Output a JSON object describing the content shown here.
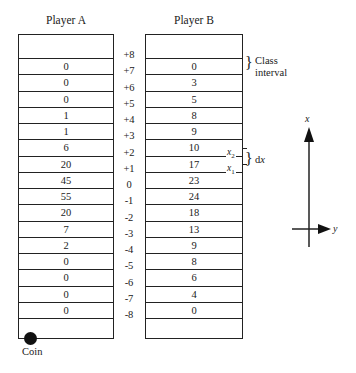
{
  "diagram": {
    "player_a": {
      "title": "Player A",
      "values": [
        "0",
        "0",
        "0",
        "1",
        "1",
        "6",
        "20",
        "45",
        "55",
        "20",
        "7",
        "2",
        "0",
        "0",
        "0",
        "0"
      ]
    },
    "player_b": {
      "title": "Player B",
      "values": [
        "0",
        "3",
        "5",
        "8",
        "9",
        "10",
        "17",
        "23",
        "24",
        "18",
        "13",
        "9",
        "8",
        "6",
        "4",
        "0"
      ]
    },
    "scale_labels": [
      "+8",
      "+7",
      "+6",
      "+5",
      "+4",
      "+3",
      "+2",
      "+1",
      "0",
      "-1",
      "-2",
      "-3",
      "-4",
      "-5",
      "-6",
      "-7",
      "-8"
    ],
    "annotations": {
      "class_interval_line1": "Class",
      "class_interval_line2": "interval",
      "x2": "x",
      "x2_sub": "2",
      "x1": "x",
      "x1_sub": "1",
      "dx_d": "d",
      "dx_x": "x",
      "brace": "}",
      "coin": "Coin"
    },
    "axes": {
      "vertical_label": "x",
      "horizontal_label": "y"
    }
  }
}
